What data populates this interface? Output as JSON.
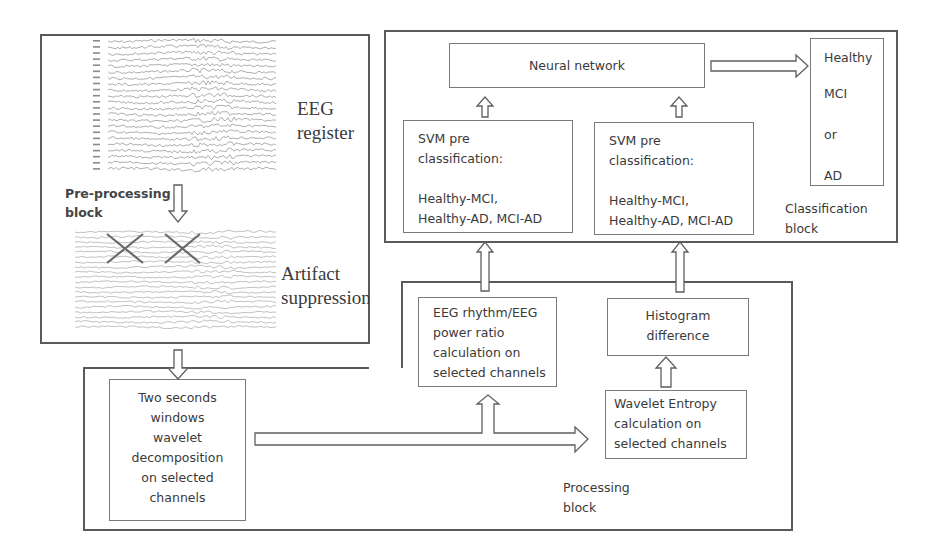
{
  "input_block": {
    "eeg_register_label": [
      "EEG",
      "register"
    ],
    "preprocessing_label": [
      "Pre-processing",
      "block"
    ],
    "artifact_label": [
      "Artifact",
      "suppression"
    ],
    "eeg_channel_rows": 22,
    "artifact_channel_rows": 20,
    "artifact_marks": 2
  },
  "processing_block": {
    "label": [
      "Processing",
      "block"
    ],
    "windows_box": [
      "Two seconds",
      "windows",
      "wavelet",
      "decomposition",
      "on selected",
      "channels"
    ],
    "rhythm_box": [
      "EEG rhythm/EEG",
      "power ratio",
      "calculation on",
      "selected channels"
    ],
    "histogram_box": [
      "Histogram",
      "difference"
    ],
    "entropy_box": [
      "Wavelet Entropy",
      "calculation on",
      "selected channels"
    ]
  },
  "classification_block": {
    "label": [
      "Classification",
      "block"
    ],
    "neural_network": "Neural network",
    "svm_left": {
      "title": [
        "SVM pre",
        "classification:"
      ],
      "pairs": [
        "Healthy-MCI,",
        "Healthy-AD, MCI-AD"
      ]
    },
    "svm_right": {
      "title": [
        "SVM pre",
        "classification:"
      ],
      "pairs": [
        "Healthy-MCI,",
        "Healthy-AD, MCI-AD"
      ]
    },
    "output": [
      "Healthy",
      "MCI",
      "or",
      "AD"
    ]
  },
  "colors": {
    "block_border": "#5a5a5a",
    "box_border": "#7a7a7a",
    "text": "#3a3a3a",
    "trace": "#9a9a9a",
    "mark": "#6a6a6a"
  }
}
